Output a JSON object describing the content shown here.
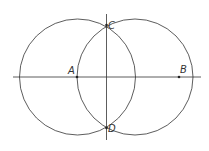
{
  "diagram": {
    "stroke_color": "#333333",
    "background": "#ffffff",
    "circles": [
      {
        "name": "left-circle",
        "cx": 77.5,
        "cy": 77,
        "r": 58
      },
      {
        "name": "right-circle",
        "cx": 135,
        "cy": 77,
        "r": 58
      }
    ],
    "lines": [
      {
        "name": "horizontal-line",
        "x1": 13,
        "y1": 77,
        "x2": 201,
        "y2": 77
      },
      {
        "name": "vertical-line",
        "x1": 106.5,
        "y1": 14,
        "x2": 106.5,
        "y2": 140
      }
    ],
    "points": [
      {
        "label": "A",
        "x": 77,
        "y": 77,
        "label_x": 68,
        "label_y": 74
      },
      {
        "label": "B",
        "x": 179,
        "y": 77,
        "label_x": 180,
        "label_y": 73
      },
      {
        "label": "C",
        "x": 106.5,
        "y": 25,
        "label_x": 108,
        "label_y": 29
      },
      {
        "label": "D",
        "x": 106.5,
        "y": 128,
        "label_x": 108,
        "label_y": 132
      }
    ]
  }
}
